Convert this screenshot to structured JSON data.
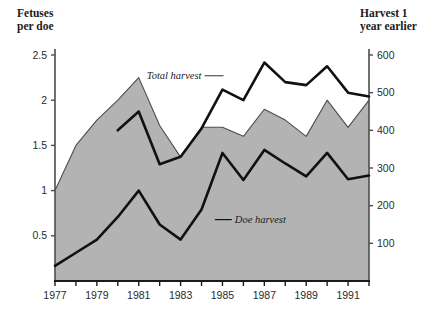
{
  "figure": {
    "left_axis_title": "Fetuses\nper doe",
    "right_axis_title": "Harvest 1\nyear earlier"
  },
  "chart_data": {
    "type": "area",
    "title": "",
    "xlabel": "",
    "ylabel": "Fetuses per doe",
    "y2label": "Harvest 1 year earlier",
    "grid": false,
    "legend": "inline-annotations",
    "x": [
      1977,
      1978,
      1979,
      1980,
      1981,
      1982,
      1983,
      1984,
      1985,
      1986,
      1987,
      1988,
      1989,
      1990,
      1991,
      1992
    ],
    "xlim": [
      1977,
      1992
    ],
    "x_tick_labels": [
      "1977",
      "1979",
      "1981",
      "1983",
      "1985",
      "1987",
      "1989",
      "1991"
    ],
    "x_tick_values": [
      1977,
      1979,
      1981,
      1983,
      1985,
      1987,
      1989,
      1991
    ],
    "ylim": [
      0,
      2.5
    ],
    "y_tick_labels": [
      "0.5",
      "1",
      "1.5",
      "2",
      "2.5"
    ],
    "y_tick_values": [
      0.5,
      1,
      1.5,
      2,
      2.5
    ],
    "y2lim": [
      0,
      600
    ],
    "y2_tick_labels": [
      "100",
      "200",
      "300",
      "400",
      "500",
      "600"
    ],
    "y2_tick_values": [
      100,
      200,
      300,
      400,
      500,
      600
    ],
    "series": [
      {
        "name": "Fetuses per doe",
        "type": "area",
        "axis": "left",
        "fill": "#b3b3b3",
        "stroke": "#4d4d4d",
        "label": "",
        "x": [
          1977,
          1978,
          1979,
          1980,
          1981,
          1982,
          1983,
          1984,
          1985,
          1986,
          1987,
          1988,
          1989,
          1990,
          1991,
          1992
        ],
        "values": [
          1.0,
          1.5,
          1.78,
          2.0,
          2.25,
          1.72,
          1.37,
          1.7,
          1.7,
          1.6,
          1.9,
          1.78,
          1.6,
          2.0,
          1.7,
          2.0
        ]
      },
      {
        "name": "Total harvest",
        "type": "line",
        "axis": "right",
        "stroke": "#111111",
        "label": "Total harvest",
        "x": [
          1980,
          1981,
          1982,
          1983,
          1984,
          1985,
          1986,
          1987,
          1988,
          1989,
          1990,
          1991,
          1992
        ],
        "values": [
          400,
          450,
          310,
          330,
          405,
          508,
          480,
          580,
          528,
          520,
          570,
          500,
          490
        ]
      },
      {
        "name": "Doe harvest",
        "type": "line",
        "axis": "right",
        "stroke": "#111111",
        "label": "Doe harvest",
        "x": [
          1977,
          1978,
          1979,
          1980,
          1981,
          1982,
          1983,
          1984,
          1985,
          1986,
          1987,
          1988,
          1989,
          1990,
          1991,
          1992
        ],
        "values": [
          40,
          75,
          110,
          170,
          240,
          150,
          110,
          190,
          340,
          268,
          348,
          312,
          278,
          340,
          270,
          280
        ]
      }
    ],
    "annotations": [
      {
        "text": "Total harvest",
        "x": 1984.0,
        "y2": 545
      },
      {
        "text": "Doe harvest",
        "x": 1985.4,
        "y2": 163
      }
    ]
  }
}
